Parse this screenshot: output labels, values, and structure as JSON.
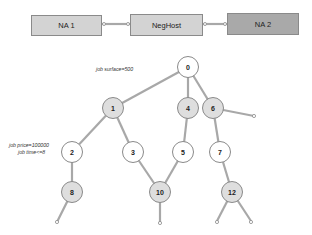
{
  "top_row": {
    "boxes": [
      {
        "id": "na1",
        "label": "NA 1",
        "fill": "#d3d3d3"
      },
      {
        "id": "neghost",
        "label": "NegHost",
        "fill": "#d3d3d3"
      },
      {
        "id": "na2",
        "label": "NA 2",
        "fill": "#a9a9a9"
      }
    ]
  },
  "tree": {
    "nodes": [
      {
        "id": "0",
        "label": "0",
        "fill": "white"
      },
      {
        "id": "1",
        "label": "1",
        "fill": "gray"
      },
      {
        "id": "4",
        "label": "4",
        "fill": "gray"
      },
      {
        "id": "6",
        "label": "6",
        "fill": "gray"
      },
      {
        "id": "2",
        "label": "2",
        "fill": "white"
      },
      {
        "id": "3",
        "label": "3",
        "fill": "white"
      },
      {
        "id": "5",
        "label": "5",
        "fill": "white"
      },
      {
        "id": "7",
        "label": "7",
        "fill": "white"
      },
      {
        "id": "8",
        "label": "8",
        "fill": "gray"
      },
      {
        "id": "10",
        "label": "10",
        "fill": "gray"
      },
      {
        "id": "12",
        "label": "12",
        "fill": "gray"
      }
    ],
    "edges": [
      [
        "0",
        "1"
      ],
      [
        "0",
        "4"
      ],
      [
        "0",
        "6"
      ],
      [
        "1",
        "2"
      ],
      [
        "1",
        "3"
      ],
      [
        "4",
        "5"
      ],
      [
        "6",
        "7"
      ],
      [
        "2",
        "8"
      ],
      [
        "3",
        "10"
      ],
      [
        "5",
        "10"
      ],
      [
        "7",
        "12"
      ]
    ],
    "annotations": {
      "root": "job surface=500",
      "node2_line1": "job price=100000",
      "node2_line2": "job time<=8"
    }
  },
  "colors": {
    "edge": "#a8a8a8",
    "node_gray": "#dedede",
    "box_light": "#d3d3d3",
    "box_dark": "#a9a9a9"
  }
}
